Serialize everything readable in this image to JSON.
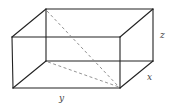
{
  "figure": {
    "type": "rectangular box (cuboid) with space diagonal",
    "labels": {
      "x": "x",
      "y": "y",
      "z": "z"
    },
    "dimensions": [
      {
        "name": "x",
        "meaning": "depth"
      },
      {
        "name": "y",
        "meaning": "width"
      },
      {
        "name": "z",
        "meaning": "height"
      }
    ],
    "diagonals": [
      {
        "name": "space-diagonal",
        "style": "dashed"
      },
      {
        "name": "base-diagonal",
        "style": "dashed"
      }
    ],
    "colors": {
      "edge": "#222222",
      "dashed": "#888888",
      "label": "#444444",
      "background": "#ffffff"
    }
  }
}
